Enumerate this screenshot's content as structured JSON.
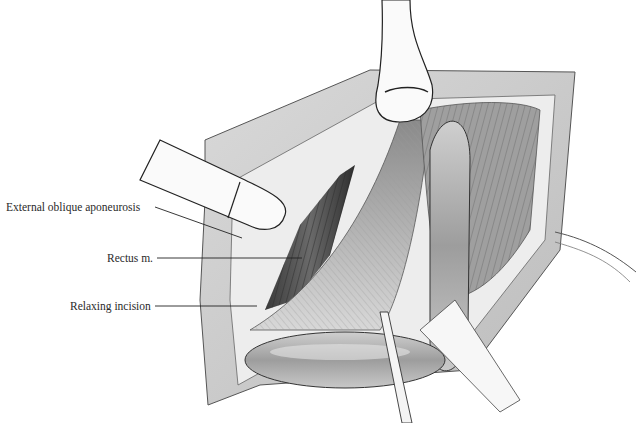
{
  "figure": {
    "labels": [
      {
        "id": "external-oblique",
        "text": "External oblique aponeurosis",
        "x": 6,
        "y": 201,
        "line": [
          155,
          207,
          242,
          238
        ]
      },
      {
        "id": "rectus",
        "text": "Rectus m.",
        "x": 107,
        "y": 252,
        "line": [
          157,
          258,
          302,
          258
        ]
      },
      {
        "id": "relaxing-incision",
        "text": "Relaxing incision",
        "x": 70,
        "y": 300,
        "line": [
          155,
          306,
          257,
          306
        ]
      }
    ],
    "colors": {
      "background": "#ffffff",
      "ink": "#2a2a2a",
      "tissue_light": "#e6e6e6",
      "tissue_mid": "#bdbdbd",
      "tissue_dark": "#5a5a5a"
    }
  }
}
